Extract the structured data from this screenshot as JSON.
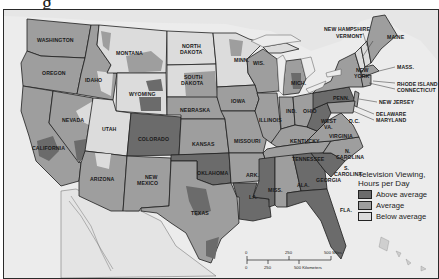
{
  "title_fragment": "g",
  "map": {
    "subject": "Television Viewing by county, United States",
    "colors": {
      "above_average": "#6b6b6b",
      "average": "#9e9e9e",
      "below_average": "#dcdcdc",
      "water": "#ececec",
      "outside": "#e2e2e2",
      "border": "#1e1e1e"
    },
    "state_labels": [
      {
        "id": "wa",
        "text": "WASHINGTON"
      },
      {
        "id": "or",
        "text": "OREGON"
      },
      {
        "id": "id",
        "text": "IDAHO"
      },
      {
        "id": "mt",
        "text": "MONTANA"
      },
      {
        "id": "wy",
        "text": "WYOMING"
      },
      {
        "id": "nd1",
        "text": "NORTH"
      },
      {
        "id": "nd2",
        "text": "DAKOTA"
      },
      {
        "id": "sd1",
        "text": "SOUTH"
      },
      {
        "id": "sd2",
        "text": "DAKOTA"
      },
      {
        "id": "ne",
        "text": "NEBRASKA"
      },
      {
        "id": "nv",
        "text": "NEVADA"
      },
      {
        "id": "ut",
        "text": "UTAH"
      },
      {
        "id": "co",
        "text": "COLORADO"
      },
      {
        "id": "ks",
        "text": "KANSAS"
      },
      {
        "id": "ca",
        "text": "CALIFORNIA"
      },
      {
        "id": "az",
        "text": "ARIZONA"
      },
      {
        "id": "nm1",
        "text": "NEW"
      },
      {
        "id": "nm2",
        "text": "MEXICO"
      },
      {
        "id": "ok",
        "text": "OKLAHOMA"
      },
      {
        "id": "tx",
        "text": "TEXAS"
      },
      {
        "id": "mn",
        "text": "MINN."
      },
      {
        "id": "wi",
        "text": "WIS."
      },
      {
        "id": "ia",
        "text": "IOWA"
      },
      {
        "id": "il",
        "text": "ILLINOIS"
      },
      {
        "id": "mo",
        "text": "MISSOURI"
      },
      {
        "id": "ar",
        "text": "ARK."
      },
      {
        "id": "la",
        "text": "LA."
      },
      {
        "id": "ms",
        "text": "MISS."
      },
      {
        "id": "mi",
        "text": "MICH."
      },
      {
        "id": "in",
        "text": "IND."
      },
      {
        "id": "oh",
        "text": "OHIO"
      },
      {
        "id": "ky",
        "text": "KENTUCKY"
      },
      {
        "id": "tn",
        "text": "TENNESSEE"
      },
      {
        "id": "al",
        "text": "ALA."
      },
      {
        "id": "ga",
        "text": "GEORGIA"
      },
      {
        "id": "fl",
        "text": "FLA."
      },
      {
        "id": "wv1",
        "text": "WEST"
      },
      {
        "id": "wv2",
        "text": "VA."
      },
      {
        "id": "va",
        "text": "VIRGINIA"
      },
      {
        "id": "nc1",
        "text": "N."
      },
      {
        "id": "nc2",
        "text": "CAROLINA"
      },
      {
        "id": "sc1",
        "text": "S."
      },
      {
        "id": "sc2",
        "text": "CAROLINA"
      },
      {
        "id": "pa",
        "text": "PENN."
      },
      {
        "id": "ny1",
        "text": "NEW"
      },
      {
        "id": "ny2",
        "text": "YORK"
      },
      {
        "id": "me",
        "text": "MAINE"
      },
      {
        "id": "dc",
        "text": "D.C."
      }
    ],
    "callout_labels": [
      {
        "id": "nh",
        "text": "NEW HAMPSHIRE"
      },
      {
        "id": "vt",
        "text": "VERMONT"
      },
      {
        "id": "ma",
        "text": "MASS."
      },
      {
        "id": "ri",
        "text": "RHODE ISLAND"
      },
      {
        "id": "ct",
        "text": "CONNECTICUT"
      },
      {
        "id": "nj",
        "text": "NEW JERSEY"
      },
      {
        "id": "de",
        "text": "DELAWARE"
      },
      {
        "id": "md",
        "text": "MARYLAND"
      }
    ]
  },
  "legend": {
    "title_line1": "Television Viewing,",
    "title_line2": "Hours per Day",
    "items": [
      {
        "label": "Above average",
        "color": "#6b6b6b"
      },
      {
        "label": "Average",
        "color": "#9e9e9e"
      },
      {
        "label": "Below average",
        "color": "#dcdcdc"
      }
    ]
  },
  "scale_bar": {
    "miles_ticks": [
      "0",
      "250",
      "500 Miles"
    ],
    "km_ticks": [
      "0",
      "250",
      "500 Kilometers"
    ]
  }
}
